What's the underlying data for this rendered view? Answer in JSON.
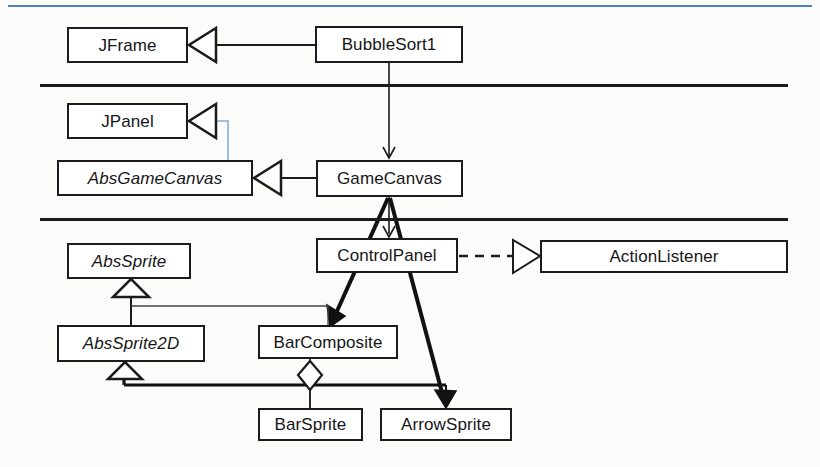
{
  "page": {
    "background_color": "#fbfbfa"
  },
  "decorations": {
    "top_blue_rule": {
      "name": "top-blue-rule",
      "color": "#4f81bd",
      "x": 8,
      "y": 5,
      "width": 804,
      "height": 2
    },
    "layer_separators": [
      {
        "name": "layer-separator-1",
        "color": "#1b1b1b",
        "x": 40,
        "y": 84,
        "width": 748,
        "height": 3
      },
      {
        "name": "layer-separator-2",
        "color": "#1b1b1b",
        "x": 40,
        "y": 218,
        "width": 748,
        "height": 3
      }
    ]
  },
  "classes": [
    {
      "id": "jframe",
      "label": "JFrame",
      "abstract": false,
      "x": 67,
      "y": 27,
      "width": 121,
      "height": 36
    },
    {
      "id": "bubblesort1",
      "label": "BubbleSort1",
      "abstract": false,
      "x": 315,
      "y": 26,
      "width": 148,
      "height": 37
    },
    {
      "id": "jpanel",
      "label": "JPanel",
      "abstract": false,
      "x": 67,
      "y": 103,
      "width": 121,
      "height": 36
    },
    {
      "id": "absgamecanvas",
      "label": "AbsGameCanvas",
      "abstract": true,
      "x": 57,
      "y": 160,
      "width": 196,
      "height": 36
    },
    {
      "id": "gamecanvas",
      "label": "GameCanvas",
      "abstract": false,
      "x": 316,
      "y": 160,
      "width": 147,
      "height": 37
    },
    {
      "id": "abssprite",
      "label": "AbsSprite",
      "abstract": true,
      "x": 67,
      "y": 243,
      "width": 124,
      "height": 36
    },
    {
      "id": "controlpanel",
      "label": "ControlPanel",
      "abstract": false,
      "x": 316,
      "y": 238,
      "width": 142,
      "height": 35
    },
    {
      "id": "actionlistener",
      "label": "ActionListener",
      "abstract": false,
      "x": 540,
      "y": 240,
      "width": 248,
      "height": 33
    },
    {
      "id": "abssprite2d",
      "label": "AbsSprite2D",
      "abstract": true,
      "x": 57,
      "y": 325,
      "width": 148,
      "height": 37
    },
    {
      "id": "barcomposite",
      "label": "BarComposite",
      "abstract": false,
      "x": 258,
      "y": 325,
      "width": 140,
      "height": 34
    },
    {
      "id": "barsprite",
      "label": "BarSprite",
      "abstract": false,
      "x": 258,
      "y": 408,
      "width": 105,
      "height": 33
    },
    {
      "id": "arrowsprite",
      "label": "ArrowSprite",
      "abstract": false,
      "x": 380,
      "y": 408,
      "width": 132,
      "height": 33
    }
  ],
  "relationships": [
    {
      "id": "bubblesort1-extends-jframe",
      "type": "generalization",
      "from": "BubbleSort1",
      "to": "JFrame",
      "style": "solid-hollow-triangle"
    },
    {
      "id": "bubblesort1-uses-gamecanvas",
      "type": "association",
      "from": "BubbleSort1",
      "to": "GameCanvas",
      "style": "solid-open-arrow"
    },
    {
      "id": "absgamecanvas-extends-jpanel",
      "type": "generalization",
      "from": "AbsGameCanvas",
      "to": "JPanel",
      "style": "solid-hollow-triangle",
      "color": "#9fc0e0"
    },
    {
      "id": "gamecanvas-extends-absgamecanvas",
      "type": "generalization",
      "from": "GameCanvas",
      "to": "AbsGameCanvas",
      "style": "solid-hollow-triangle"
    },
    {
      "id": "gamecanvas-uses-controlpanel",
      "type": "association",
      "from": "GameCanvas",
      "to": "ControlPanel",
      "style": "solid-open-arrow"
    },
    {
      "id": "gamecanvas-uses-barcomposite",
      "type": "association",
      "from": "GameCanvas",
      "to": "BarComposite",
      "style": "thick-filled-arrow"
    },
    {
      "id": "gamecanvas-uses-arrowsprite",
      "type": "association",
      "from": "GameCanvas",
      "to": "ArrowSprite",
      "style": "thick-filled-arrow"
    },
    {
      "id": "controlpanel-implements-actionlistener",
      "type": "realization",
      "from": "ControlPanel",
      "to": "ActionListener",
      "style": "dashed-hollow-triangle"
    },
    {
      "id": "abssprite2d-extends-abssprite",
      "type": "generalization",
      "from": "AbsSprite2D",
      "to": "AbsSprite",
      "style": "solid-hollow-triangle"
    },
    {
      "id": "barcomposite-extends-abssprite",
      "type": "generalization",
      "from": "BarComposite",
      "to": "AbsSprite",
      "style": "solid-hollow-triangle"
    },
    {
      "id": "barsprite-extends-abssprite2d",
      "type": "generalization",
      "from": "BarSprite",
      "to": "AbsSprite2D",
      "style": "solid-hollow-triangle"
    },
    {
      "id": "arrowsprite-extends-abssprite2d",
      "type": "generalization",
      "from": "ArrowSprite",
      "to": "AbsSprite2D",
      "style": "solid-hollow-triangle"
    },
    {
      "id": "barcomposite-aggregates-barsprite",
      "type": "aggregation",
      "from": "BarComposite",
      "to": "BarSprite",
      "style": "hollow-diamond"
    }
  ]
}
